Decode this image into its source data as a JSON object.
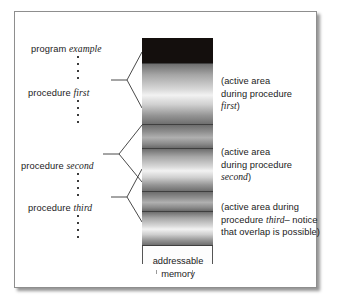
{
  "figure": {
    "bar_caption_line1": "addressable",
    "bar_caption_line2": "memory"
  },
  "left_labels": {
    "program": {
      "keyword": "program",
      "name": "example"
    },
    "first": {
      "keyword": "procedure",
      "name": "first"
    },
    "second": {
      "keyword": "procedure",
      "name": "second"
    },
    "third": {
      "keyword": "procedure",
      "name": "third"
    }
  },
  "annotations": {
    "first": {
      "line1": "(active area",
      "line2": "during procedure",
      "name": "first",
      "line3_tail": ")"
    },
    "second": {
      "line1": "(active area",
      "line2": "during procedure",
      "name": "second",
      "line3_tail": ")"
    },
    "third": {
      "line1": "(active area during",
      "line2_head": "procedure ",
      "name": "third",
      "line2_tail": "– notice",
      "line3": "that overlap is possible)"
    }
  },
  "memory_bands": [
    {
      "name": "program-example-band",
      "style": "dark",
      "top": 0,
      "height": 25
    },
    {
      "name": "procedure-first-band",
      "style": "grad",
      "top": 26,
      "height": 60
    },
    {
      "name": "gap-band-1",
      "style": "dim",
      "top": 87,
      "height": 23
    },
    {
      "name": "procedure-second-band",
      "style": "grad",
      "top": 111,
      "height": 42
    },
    {
      "name": "overlap-band",
      "style": "dim",
      "top": 154,
      "height": 19
    },
    {
      "name": "procedure-third-band",
      "style": "grad",
      "top": 174,
      "height": 33
    },
    {
      "name": "unused-band",
      "style": "empty",
      "top": 208,
      "height": 18
    }
  ],
  "colors": {
    "frame_border": "#8e8e8e",
    "text": "#1b1b1b",
    "connector": "#4a4a4a",
    "band_dark": "#140f0d",
    "band_rule": "#3f3f3f"
  }
}
